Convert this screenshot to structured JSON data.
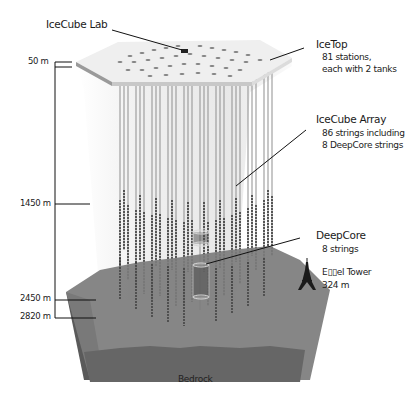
{
  "diagram": {
    "labels": {
      "lab": "IceCube Lab",
      "icetop": {
        "title": "IceTop",
        "line1": "81 stations,",
        "line2": "each with 2 tanks"
      },
      "array": {
        "title": "IceCube Array",
        "line1": "86 strings including",
        "line2": "8 DeepCore strings"
      },
      "deepcore": {
        "title": "DeepCore",
        "line1": "8 strings"
      },
      "eiffel": {
        "title": "E▯▯el Tower",
        "line1": "324 m"
      },
      "bedrock": "Bedrock"
    },
    "depths": [
      "50 m",
      "1450 m",
      "2450 m",
      "2820 m"
    ],
    "colors": {
      "surface_top": "#efefef",
      "surface_edge": "#9a9a9a",
      "ice_volume": "#f2f2f2",
      "ground": "#7d7d7d",
      "ground_side": "#5f5f5f",
      "bedrock_band": "#6a6a6a",
      "string": "#555555",
      "text": "#1a1a1a"
    }
  }
}
